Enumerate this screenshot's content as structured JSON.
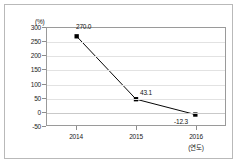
{
  "chart_data": {
    "type": "line",
    "title": "",
    "xlabel": "(연도)",
    "ylabel": "(%)",
    "categories": [
      "2014",
      "2015",
      "2016"
    ],
    "values": [
      270.0,
      43.1,
      -12.3
    ],
    "point_labels": [
      "270.0",
      "43.1",
      "-12.3"
    ],
    "series": [
      {
        "name": "",
        "values": [
          270.0,
          43.1,
          -12.3
        ],
        "marker": "square",
        "color": "#000000"
      }
    ],
    "ylim": [
      -50,
      300
    ],
    "ytick_values": [
      300,
      250,
      200,
      150,
      100,
      50,
      0,
      -50
    ],
    "ytick_labels": [
      "300",
      "250",
      "200",
      "150",
      "100",
      "50",
      "0",
      "-50"
    ],
    "grid": true,
    "legend": false
  },
  "axes": {
    "unit_label": "(%)",
    "x_axis_note": "(연도)"
  },
  "colors": {
    "series": "#000000",
    "gridline": "#e2e2e2",
    "plot_border": "#9a9a9a",
    "frame_border": "#b9b9b9",
    "text": "#222222"
  }
}
